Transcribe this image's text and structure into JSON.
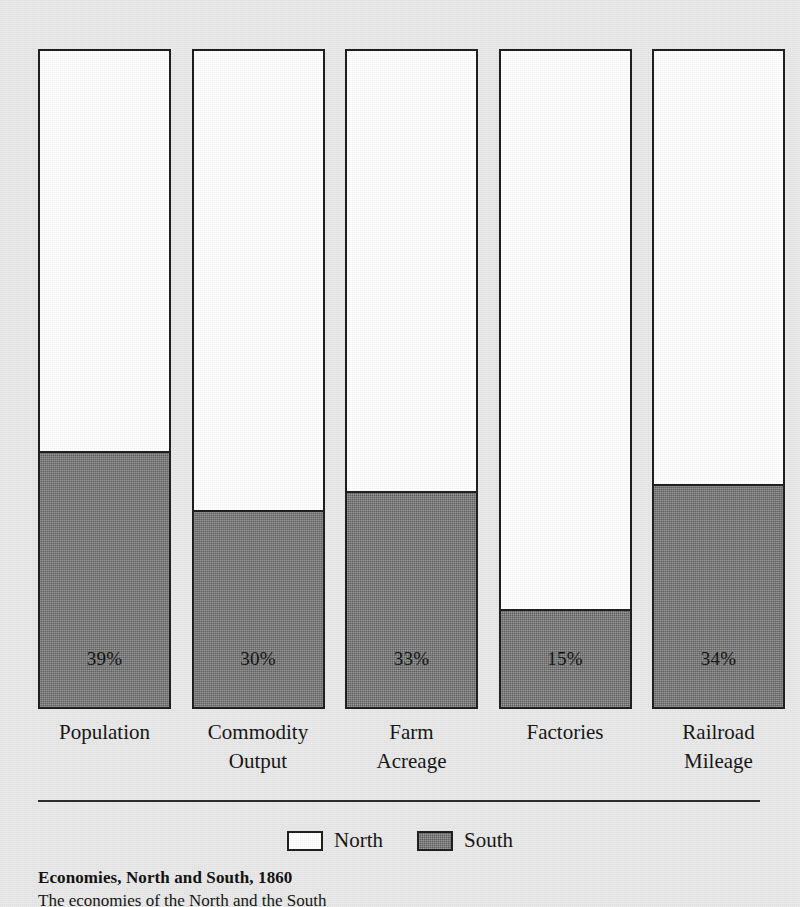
{
  "chart_data": {
    "type": "bar",
    "subtype": "stacked-100-percent",
    "title": "Economies, North and South, 1860",
    "xlabel": "",
    "ylabel": "",
    "ylim": [
      0,
      100
    ],
    "grid": false,
    "legend_position": "bottom-center",
    "categories": [
      "Population",
      "Commodity Output",
      "Farm Acreage",
      "Factories",
      "Railroad Mileage"
    ],
    "series": [
      {
        "name": "North",
        "values": [
          61,
          70,
          67,
          85,
          66
        ],
        "color": "#ffffff"
      },
      {
        "name": "South",
        "values": [
          39,
          30,
          33,
          15,
          34
        ],
        "color": "#737373"
      }
    ],
    "data_labels": [
      "39%",
      "30%",
      "33%",
      "15%",
      "34%"
    ],
    "annotations": []
  },
  "figure": {
    "bars": [
      {
        "category_line1": "Population",
        "category_line2": "",
        "south_percent": 39,
        "south_label": "39%",
        "north_percent": 61
      },
      {
        "category_line1": "Commodity",
        "category_line2": "Output",
        "south_percent": 30,
        "south_label": "30%",
        "north_percent": 70
      },
      {
        "category_line1": "Farm",
        "category_line2": "Acreage",
        "south_percent": 33,
        "south_label": "33%",
        "north_percent": 67
      },
      {
        "category_line1": "Factories",
        "category_line2": "",
        "south_percent": 15,
        "south_label": "15%",
        "north_percent": 85
      },
      {
        "category_line1": "Railroad",
        "category_line2": "Mileage",
        "south_percent": 34,
        "south_label": "34%",
        "north_percent": 66
      }
    ],
    "legend": {
      "north_label": "North",
      "south_label": "South"
    },
    "caption": {
      "title": "Economies, North and South, 1860",
      "body": "The  economies  of  the  North  and  the  South"
    },
    "colors": {
      "background": "#e9e9e9",
      "north_fill": "#ffffff",
      "south_fill": "#737373",
      "outline": "#1d1d1d",
      "text": "#141414"
    }
  }
}
